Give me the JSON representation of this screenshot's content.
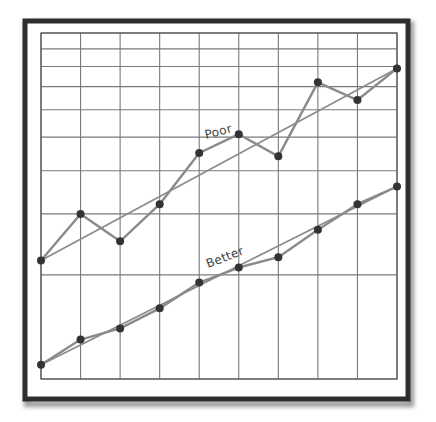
{
  "chart_data": {
    "type": "line",
    "title": "",
    "xlabel": "",
    "ylabel": "",
    "y_scale": "log",
    "ylim": [
      1,
      10
    ],
    "xlim": [
      0,
      9
    ],
    "grid": true,
    "legend": "inline labels on trend lines",
    "x": [
      0,
      1,
      2,
      3,
      4,
      5,
      6,
      7,
      8,
      9
    ],
    "series": [
      {
        "name": "Poor",
        "values": [
          2.2,
          3.0,
          2.5,
          3.2,
          4.5,
          5.1,
          4.4,
          7.2,
          6.4,
          7.9
        ],
        "trend_line": [
          2.2,
          7.9
        ]
      },
      {
        "name": "Better",
        "values": [
          1.1,
          1.3,
          1.4,
          1.6,
          1.9,
          2.1,
          2.25,
          2.7,
          3.2,
          3.6
        ],
        "trend_line": [
          1.1,
          3.6
        ]
      }
    ],
    "gridlines_y": [
      1,
      2,
      3,
      4,
      5,
      6,
      7,
      8,
      9,
      10
    ],
    "gridlines_x": [
      0,
      1,
      2,
      3,
      4,
      5,
      6,
      7,
      8,
      9
    ]
  },
  "labels": {
    "poor": "Poor",
    "better": "Better"
  },
  "colors": {
    "frame": "#2e2e2e",
    "grid": "#7a7a7a",
    "line": "#8a8a8a",
    "dot": "#333333",
    "label": "#444444"
  }
}
